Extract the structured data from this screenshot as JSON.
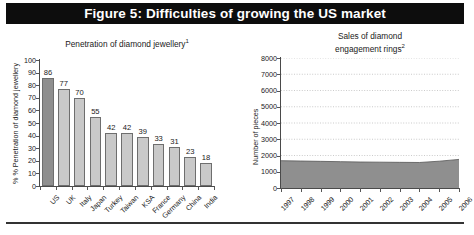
{
  "figure": {
    "title": "Figure 5: Difficulties of growing the US market",
    "title_bar_color": "#0d0d0d",
    "title_text_color": "#ffffff"
  },
  "chart_data": [
    {
      "type": "bar",
      "title": "Penetration of diamond jewellery",
      "title_superscript": "1",
      "xlabel": "",
      "ylabel": "% Penetration of diamond jewellery",
      "ylim": [
        0,
        100
      ],
      "yticks": [
        0,
        10,
        20,
        30,
        40,
        50,
        60,
        70,
        80,
        90,
        100
      ],
      "grid": false,
      "legend": "none",
      "categories": [
        "US",
        "UK",
        "Italy",
        "Japan",
        "Turkey",
        "Taiwan",
        "KSA",
        "France",
        "Germany",
        "China",
        "India"
      ],
      "values": [
        86,
        77,
        70,
        55,
        42,
        42,
        39,
        33,
        31,
        23,
        18
      ],
      "highlight_index": 0,
      "bar_color": "#c9c9c9",
      "highlight_color": "#8f8f8f",
      "bar_border_color": "#6e6e6e"
    },
    {
      "type": "area",
      "title_line1": "Sales of diamond",
      "title_line2": "engagement rings",
      "title_superscript": "2",
      "xlabel": "",
      "ylabel": "Number of pieces",
      "ylim": [
        0,
        8000
      ],
      "yticks": [
        0,
        1000,
        2000,
        3000,
        4000,
        5000,
        6000,
        7000,
        8000
      ],
      "grid": true,
      "legend": "none",
      "x": [
        "1997",
        "1998",
        "1999",
        "2000",
        "2001",
        "2002",
        "2003",
        "2004",
        "2005",
        "2006"
      ],
      "values": [
        1680,
        1660,
        1640,
        1620,
        1600,
        1590,
        1580,
        1570,
        1650,
        1760
      ],
      "area_color": "#8f8f8f",
      "area_border_color": "#555555"
    }
  ]
}
